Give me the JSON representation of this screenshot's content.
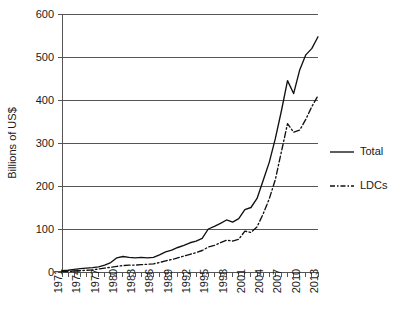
{
  "chart_data": {
    "type": "line",
    "title": "",
    "subtitle": "",
    "xlabel": "",
    "ylabel": "Billions of US$",
    "ylim": [
      0,
      600
    ],
    "xlim": [
      1971,
      2013
    ],
    "y_ticks": [
      0,
      100,
      200,
      300,
      400,
      500,
      600
    ],
    "y_tick_labels": [
      "0",
      "100",
      "200",
      "300",
      "400",
      "500",
      "600"
    ],
    "x_tick_labels": [
      "1971",
      "1974",
      "1977",
      "1980",
      "1983",
      "1986",
      "1989",
      "1992",
      "1995",
      "1998",
      "2001",
      "2004",
      "2007",
      "2010",
      "2013"
    ],
    "x_tick_label_interval_years": 3,
    "x_minor_tick_interval_years": 1,
    "grid": "horizontal",
    "legend_position": "right-outside",
    "x": [
      1971,
      1972,
      1973,
      1974,
      1975,
      1976,
      1977,
      1978,
      1979,
      1980,
      1981,
      1982,
      1983,
      1984,
      1985,
      1986,
      1987,
      1988,
      1989,
      1990,
      1991,
      1992,
      1993,
      1994,
      1995,
      1996,
      1997,
      1998,
      1999,
      2000,
      2001,
      2002,
      2003,
      2004,
      2005,
      2006,
      2007,
      2008,
      2009,
      2010,
      2011,
      2012,
      2013
    ],
    "series": [
      {
        "name": "Total",
        "style": "solid",
        "color": "#111111",
        "values": [
          3,
          4,
          6,
          8,
          9,
          10,
          12,
          16,
          22,
          33,
          36,
          34,
          33,
          34,
          33,
          34,
          40,
          47,
          51,
          57,
          62,
          68,
          72,
          78,
          100,
          106,
          113,
          121,
          116,
          124,
          145,
          150,
          171,
          213,
          255,
          310,
          375,
          445,
          415,
          470,
          505,
          520,
          547
        ]
      },
      {
        "name": "LDCs",
        "style": "dash-dot",
        "color": "#111111",
        "values": [
          1,
          1,
          2,
          3,
          4,
          5,
          7,
          9,
          11,
          13,
          15,
          16,
          16,
          17,
          18,
          19,
          22,
          26,
          29,
          33,
          37,
          41,
          45,
          50,
          58,
          62,
          68,
          74,
          72,
          76,
          95,
          92,
          105,
          135,
          170,
          215,
          280,
          345,
          325,
          330,
          355,
          385,
          410
        ]
      }
    ],
    "legend": [
      {
        "label": "Total",
        "style": "solid"
      },
      {
        "label": "LDCs",
        "style": "dash-dot"
      }
    ]
  },
  "colors": {
    "background": "#ffffff",
    "axis": "#555555",
    "grid": "#555555",
    "series": "#111111",
    "text": "#1a1a1a"
  }
}
